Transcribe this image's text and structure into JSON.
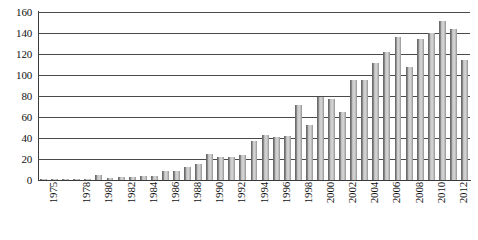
{
  "chart_data": {
    "type": "bar",
    "title": "",
    "subtitle": "",
    "xlabel": "",
    "ylabel": "",
    "xlim": [
      1975,
      2013
    ],
    "ylim": [
      0,
      160
    ],
    "ytick_step": 20,
    "yticks": [
      0,
      20,
      40,
      60,
      80,
      100,
      120,
      140,
      160
    ],
    "ytick_labels": [
      "0",
      "20",
      "40",
      "60",
      "80",
      "100",
      "120",
      "140",
      "160"
    ],
    "grid": true,
    "legend": false,
    "legend_position": "none",
    "bar_color": "#b0b0b0",
    "bar_edge_color": "#6e6e6e",
    "axis_color": "#3a3a3a",
    "gridline_color": "#4a4a4a",
    "background_color": "#ffffff",
    "xtick_rotation": 90,
    "xtick_labels_shown": [
      "1975",
      "1978",
      "1980",
      "1982",
      "1984",
      "1986",
      "1988",
      "1990",
      "1992",
      "1994",
      "1996",
      "1998",
      "2000",
      "2002",
      "2004",
      "2006",
      "2008",
      "2010",
      "2012"
    ],
    "categories": [
      "1975",
      "1976",
      "1977",
      "1978",
      "1979",
      "1980",
      "1981",
      "1982",
      "1983",
      "1984",
      "1985",
      "1986",
      "1987",
      "1988",
      "1989",
      "1990",
      "1991",
      "1992",
      "1993",
      "1994",
      "1995",
      "1996",
      "1997",
      "1998",
      "1999",
      "2000",
      "2001",
      "2002",
      "2003",
      "2004",
      "2005",
      "2006",
      "2007",
      "2008",
      "2009",
      "2010",
      "2011",
      "2012",
      "2013"
    ],
    "values": [
      1,
      1,
      1,
      1,
      1,
      5,
      2,
      3,
      3,
      4,
      4,
      9,
      9,
      12,
      15,
      25,
      22,
      22,
      24,
      37,
      43,
      41,
      42,
      71,
      52,
      79,
      77,
      65,
      95,
      95,
      111,
      122,
      136,
      108,
      134,
      140,
      151,
      144,
      114
    ],
    "values_labeled": false,
    "max_value": 151,
    "max_value_year": "2011",
    "min_value": 1,
    "min_value_year": "1975"
  }
}
